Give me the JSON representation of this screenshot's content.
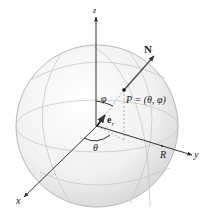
{
  "diagram": {
    "axes": {
      "z_label": "z",
      "y_label": "y",
      "x_label": "x"
    },
    "labels": {
      "normal": "N",
      "point": "P = (θ, φ)",
      "phi": "φ",
      "theta": "θ",
      "unit_vector_base": "e",
      "unit_vector_sub": "r",
      "radius": "R"
    },
    "colors": {
      "sphere_fill": "#eeeeee",
      "sphere_edge": "#b0b0b0",
      "axis": "#333333",
      "grid": "#c8c8c8",
      "dashed": "#9a9a9a"
    }
  }
}
